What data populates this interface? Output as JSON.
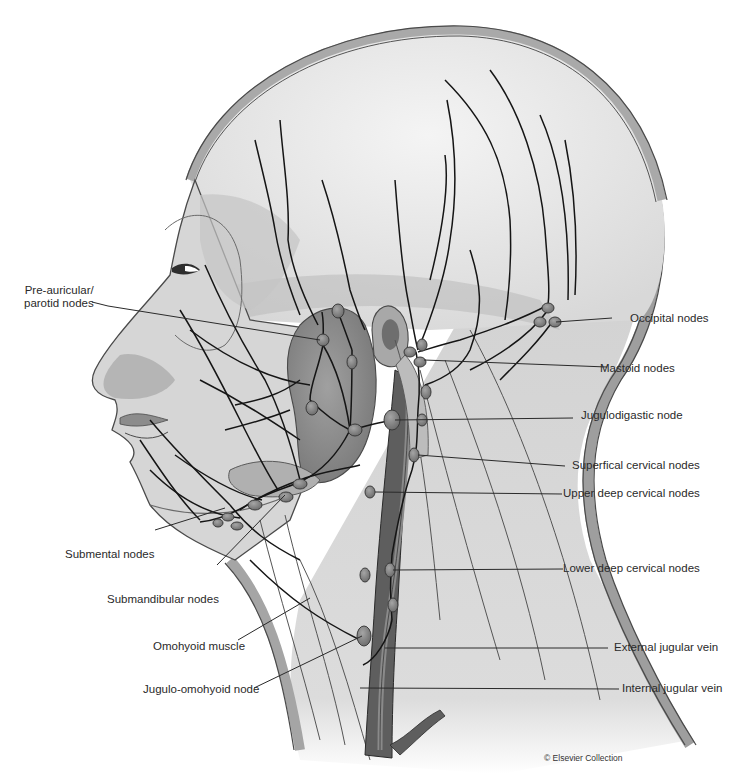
{
  "figure": {
    "credit": "© Elsevier Collection"
  },
  "labels_left": [
    {
      "id": "pre-auricular",
      "line1": "Pre-auricular/",
      "line2": "parotid nodes"
    },
    {
      "id": "submental",
      "text": "Submental nodes"
    },
    {
      "id": "submandibular",
      "text": "Submandibular nodes"
    },
    {
      "id": "omohyoid-muscle",
      "text": "Omohyoid muscle"
    },
    {
      "id": "jugulo-omohyoid",
      "text": "Jugulo-omohyoid node"
    }
  ],
  "labels_right": [
    {
      "id": "occipital",
      "text": "Occipital nodes"
    },
    {
      "id": "mastoid",
      "text": "Mastoid nodes"
    },
    {
      "id": "jugulodigastic",
      "text": "Jugulodigastic node"
    },
    {
      "id": "superficial-cervical",
      "text": "Superfical cervical nodes"
    },
    {
      "id": "upper-deep-cervical",
      "text": "Upper deep cervical nodes"
    },
    {
      "id": "lower-deep-cervical",
      "text": "Lower deep cervical nodes"
    },
    {
      "id": "external-jugular",
      "text": "External jugular vein"
    },
    {
      "id": "internal-jugular",
      "text": "Internal jugular vein"
    }
  ],
  "colors": {
    "skin": "#d4d4d4",
    "skin_light": "#e6e6e6",
    "outline": "#4a4a4a",
    "scalp_rim": "#a8a8a8",
    "gland": "#8f8f8f",
    "node": "#7c7c7c",
    "vessel": "#1a1a1a",
    "vein": "#6e6e6e"
  }
}
